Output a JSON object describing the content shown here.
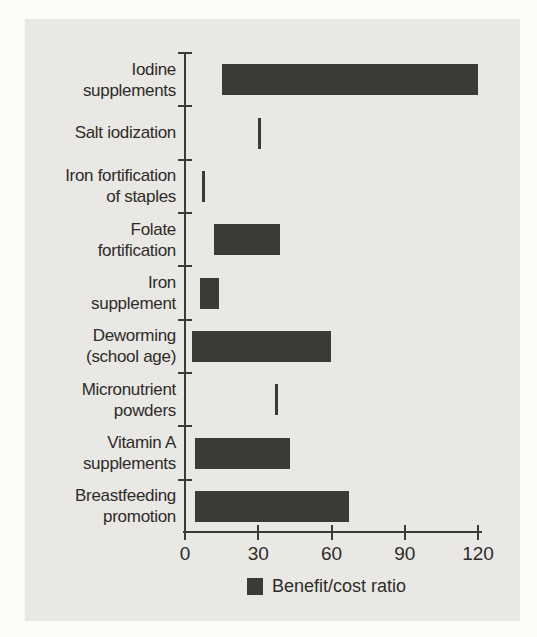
{
  "chart_data": {
    "type": "bar",
    "orientation": "horizontal",
    "style": "range",
    "title": "",
    "xlabel": "",
    "ylabel": "",
    "xlim": [
      0,
      120
    ],
    "x_ticks": [
      0,
      30,
      60,
      90,
      120
    ],
    "grid": false,
    "legend": "Benefit/cost ratio",
    "legend_position": "bottom",
    "rows": [
      {
        "label": "Iodine supplements",
        "label_lines": [
          "Iodine",
          "supplements"
        ],
        "low": 15,
        "high": 120
      },
      {
        "label": "Salt iodization",
        "label_lines": [
          "Salt iodization"
        ],
        "low": 30,
        "high": 30
      },
      {
        "label": "Iron fortification of staples",
        "label_lines": [
          "Iron fortification",
          "of staples"
        ],
        "low": 7,
        "high": 7
      },
      {
        "label": "Folate fortification",
        "label_lines": [
          "Folate",
          "fortification"
        ],
        "low": 12,
        "high": 39
      },
      {
        "label": "Iron supplement",
        "label_lines": [
          "Iron",
          "supplement"
        ],
        "low": 6,
        "high": 14
      },
      {
        "label": "Deworming (school age)",
        "label_lines": [
          "Deworming",
          "(school age)"
        ],
        "low": 3,
        "high": 60
      },
      {
        "label": "Micronutrient powders",
        "label_lines": [
          "Micronutrient",
          "powders"
        ],
        "low": 37,
        "high": 37
      },
      {
        "label": "Vitamin A supplements",
        "label_lines": [
          "Vitamin A",
          "supplements"
        ],
        "low": 4,
        "high": 43
      },
      {
        "label": "Breastfeeding promotion",
        "label_lines": [
          "Breastfeeding",
          "promotion"
        ],
        "low": 4,
        "high": 67
      }
    ],
    "colors": {
      "bar": "#3b3a37",
      "axis": "#3b3a37",
      "text": "#2d2c29",
      "panel_bg": "#e9e8e4",
      "page_bg": "#fbfbf7"
    }
  }
}
